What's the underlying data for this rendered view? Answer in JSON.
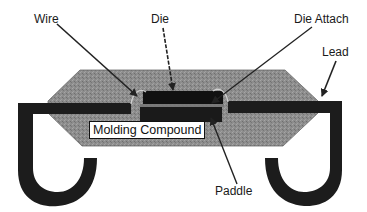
{
  "diagram": {
    "title": "",
    "type": "IC package cross-section",
    "labels": {
      "wire": "Wire",
      "die": "Die",
      "die_attach": "Die Attach",
      "lead": "Lead",
      "molding_compound": "Molding Compound",
      "paddle": "Paddle"
    },
    "colors": {
      "background": "#ffffff",
      "molding_compound": "#8c8c8c",
      "lead": "#1c1c1c",
      "die": "#111111",
      "paddle": "#1a1a1a",
      "arrow": "#222222"
    },
    "components": [
      {
        "name": "Wire",
        "description": "bond wire connecting die to lead"
      },
      {
        "name": "Die",
        "description": "silicon die"
      },
      {
        "name": "Die Attach",
        "description": "layer bonding die to paddle"
      },
      {
        "name": "Lead",
        "description": "J-shaped external lead (left and right)"
      },
      {
        "name": "Molding Compound",
        "description": "encapsulating package body"
      },
      {
        "name": "Paddle",
        "description": "die pad below die"
      }
    ]
  }
}
